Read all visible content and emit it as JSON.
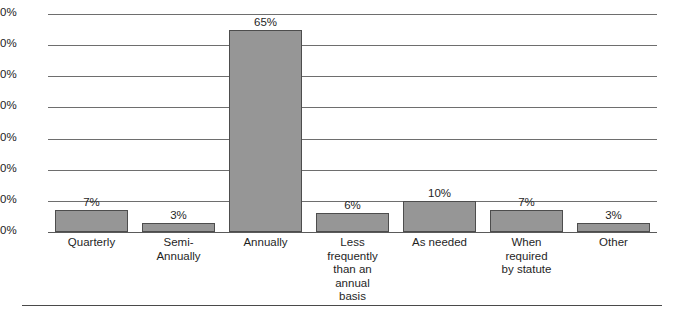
{
  "chart_data": {
    "type": "bar",
    "title": "",
    "xlabel": "",
    "ylabel": "",
    "categories": [
      "Quarterly",
      "Semi-\nAnnually",
      "Annually",
      "Less\nfrequently\nthan an\nannual\nbasis",
      "As needed",
      "When\nrequired\nby statute",
      "Other"
    ],
    "values": [
      7,
      3,
      65,
      6,
      10,
      7,
      3
    ],
    "value_labels": [
      "7%",
      "3%",
      "65%",
      "6%",
      "10%",
      "7%",
      "3%"
    ],
    "ylim": [
      0,
      70
    ],
    "ytick_values": [
      70,
      60,
      50,
      40,
      30,
      20,
      10,
      0
    ],
    "ytick_labels": [
      "70%",
      "60%",
      "50%",
      "40%",
      "30%",
      "20%",
      "10%",
      "0%"
    ],
    "grid": true,
    "grid_axis": "y",
    "legend": false,
    "legend_position": "none",
    "bar_color": "#969696",
    "bar_border_color": "#4d4d4d",
    "gridline_color": "#6e6e6e",
    "background_color": "#ffffff",
    "text_color": "#1f1f1f"
  }
}
